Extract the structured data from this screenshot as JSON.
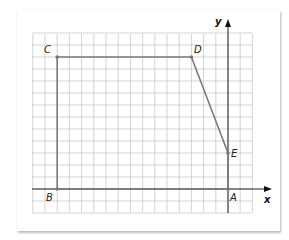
{
  "diagram": {
    "type": "coordinate-grid-polygon",
    "axes": {
      "x_label": "x",
      "y_label": "y"
    },
    "grid": {
      "columns": 18,
      "rows": 14,
      "line_color": "#c8c8c8"
    },
    "colors": {
      "polygon_stroke": "#7a7a7a",
      "axis": "#222222",
      "grid": "#c8c8c8"
    },
    "points": [
      {
        "label": "A",
        "x": 0,
        "y": 0
      },
      {
        "label": "B",
        "x": -14,
        "y": 0
      },
      {
        "label": "C",
        "x": -14,
        "y": 11
      },
      {
        "label": "D",
        "x": -3,
        "y": 11
      },
      {
        "label": "E",
        "x": 0,
        "y": 3
      }
    ],
    "polygon_order": [
      "A",
      "B",
      "C",
      "D",
      "E"
    ]
  },
  "labels": {
    "A": "A",
    "B": "B",
    "C": "C",
    "D": "D",
    "E": "E",
    "x_axis": "x",
    "y_axis": "y"
  }
}
